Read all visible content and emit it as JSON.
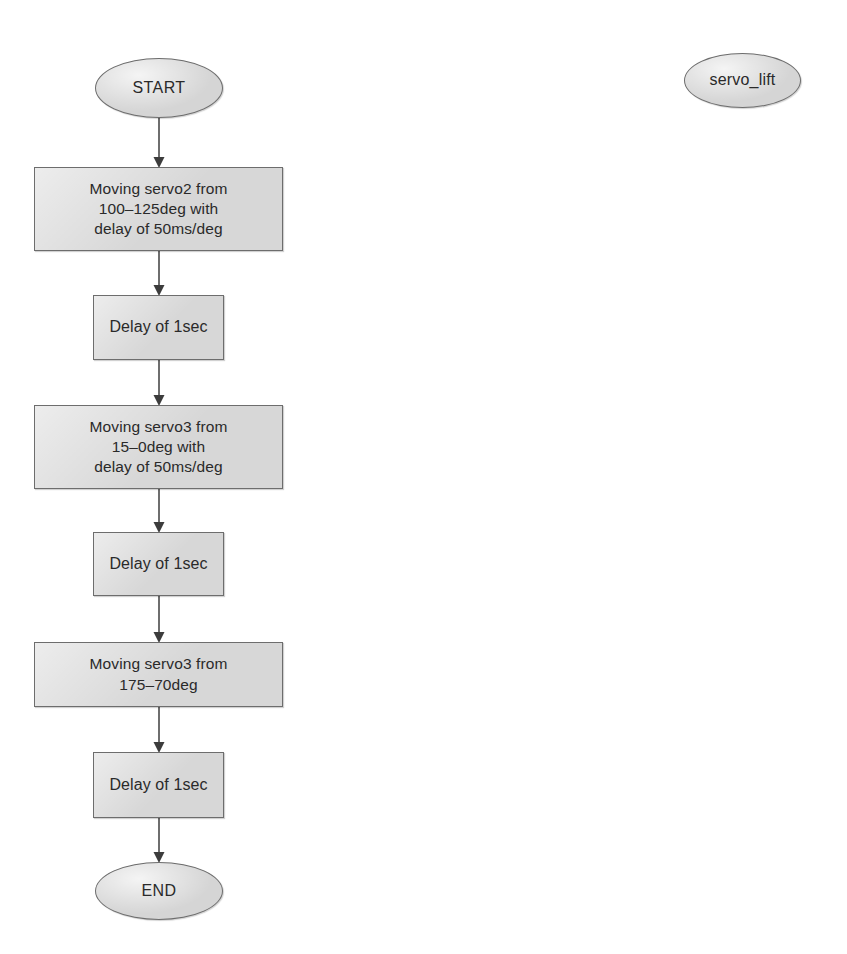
{
  "diagram": {
    "title": "servo_lift",
    "tag_node": {
      "id": "servo-lift-tag",
      "label": "servo_lift",
      "shape": "ellipse",
      "x": 684,
      "y": 53,
      "w": 117,
      "h": 55
    },
    "nodes": [
      {
        "id": "start",
        "label": "START",
        "shape": "ellipse",
        "kind": "terminator",
        "x": 95,
        "y": 58,
        "w": 128,
        "h": 60
      },
      {
        "id": "move-servo2",
        "label": "Moving servo2 from\n100–125deg with\ndelay of 50ms/deg",
        "shape": "rectangle",
        "kind": "process",
        "x": 34,
        "y": 167,
        "w": 249,
        "h": 84
      },
      {
        "id": "delay-1",
        "label": "Delay of 1sec",
        "shape": "rectangle",
        "kind": "process",
        "x": 93,
        "y": 295,
        "w": 131,
        "h": 65
      },
      {
        "id": "move-servo3-15-0",
        "label": "Moving servo3 from\n15–0deg with\ndelay of 50ms/deg",
        "shape": "rectangle",
        "kind": "process",
        "x": 34,
        "y": 405,
        "w": 249,
        "h": 84
      },
      {
        "id": "delay-2",
        "label": "Delay of 1sec",
        "shape": "rectangle",
        "kind": "process",
        "x": 93,
        "y": 532,
        "w": 131,
        "h": 64
      },
      {
        "id": "move-servo3-175-70",
        "label": "Moving servo3 from\n175–70deg",
        "shape": "rectangle",
        "kind": "process",
        "x": 34,
        "y": 642,
        "w": 249,
        "h": 65
      },
      {
        "id": "delay-3",
        "label": "Delay of 1sec",
        "shape": "rectangle",
        "kind": "process",
        "x": 93,
        "y": 752,
        "w": 131,
        "h": 66
      },
      {
        "id": "end",
        "label": "END",
        "shape": "ellipse",
        "kind": "terminator",
        "x": 95,
        "y": 862,
        "w": 128,
        "h": 58
      }
    ],
    "edges": [
      {
        "id": "edge-start-move-servo2",
        "from": "start",
        "to": "move-servo2",
        "x": 159,
        "y1": 118,
        "y2": 167
      },
      {
        "id": "edge-move-servo2-delay-1",
        "from": "move-servo2",
        "to": "delay-1",
        "x": 159,
        "y1": 251,
        "y2": 295
      },
      {
        "id": "edge-delay-1-move-servo3",
        "from": "delay-1",
        "to": "move-servo3-15-0",
        "x": 159,
        "y1": 360,
        "y2": 405
      },
      {
        "id": "edge-move-servo3-delay-2",
        "from": "move-servo3-15-0",
        "to": "delay-2",
        "x": 159,
        "y1": 489,
        "y2": 532
      },
      {
        "id": "edge-delay-2-move-servo3-175",
        "from": "delay-2",
        "to": "move-servo3-175-70",
        "x": 159,
        "y1": 596,
        "y2": 642
      },
      {
        "id": "edge-move-servo3-175-delay-3",
        "from": "move-servo3-175-70",
        "to": "delay-3",
        "x": 159,
        "y1": 707,
        "y2": 752
      },
      {
        "id": "edge-delay-3-end",
        "from": "delay-3",
        "to": "end",
        "x": 159,
        "y1": 818,
        "y2": 862
      }
    ],
    "colors": {
      "node_fill": "#d6d6d6",
      "node_stroke": "#6d6d6d",
      "connector": "#4a4a4a",
      "text": "#2a2a2a",
      "background": "#ffffff"
    }
  }
}
